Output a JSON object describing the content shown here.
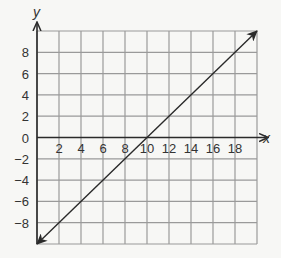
{
  "chart_data": {
    "type": "line",
    "title": "",
    "xlabel": "x",
    "ylabel": "y",
    "xlim": [
      0,
      20
    ],
    "ylim": [
      -10,
      10
    ],
    "grid": true,
    "grid_step": 2,
    "x_ticks": [
      2,
      4,
      6,
      8,
      10,
      12,
      14,
      16,
      18
    ],
    "x_tick_labels": [
      "2",
      "4",
      "6",
      "8",
      "10",
      "12",
      "14",
      "16",
      "18"
    ],
    "y_ticks": [
      8,
      6,
      4,
      2,
      0,
      -2,
      -4,
      -6,
      -8
    ],
    "y_tick_labels": [
      "8",
      "6",
      "4",
      "2",
      "0",
      "−2",
      "−4",
      "−6",
      "−8"
    ],
    "series": [
      {
        "name": "y = x - 10",
        "x": [
          0,
          20
        ],
        "y": [
          -10,
          10
        ],
        "arrows": "both"
      }
    ]
  }
}
